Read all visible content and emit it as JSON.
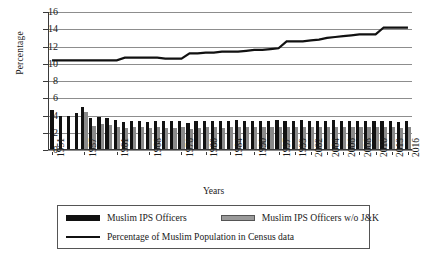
{
  "chart_data": {
    "type": "bar",
    "title": "",
    "xlabel": "Years",
    "ylabel": "Percentage",
    "ylim": [
      0,
      16
    ],
    "ytick_values": [
      0,
      2,
      4,
      6,
      8,
      10,
      12,
      14,
      16
    ],
    "ytick_labels": [
      "0",
      "2",
      "4",
      "6",
      "8",
      "10",
      "12",
      "14",
      "16"
    ],
    "grid": true,
    "legend_position": "bottom",
    "categories": [
      "1951",
      "1952",
      "1953",
      "1954",
      "1957",
      "1958",
      "1959",
      "1960",
      "1961",
      "1963",
      "1965",
      "1966",
      "1968",
      "1970",
      "1972",
      "1974",
      "1976",
      "1978",
      "1979",
      "1980",
      "1982",
      "1983",
      "1984",
      "1986",
      "1988",
      "1990",
      "1992",
      "1994",
      "1997",
      "1998",
      "1999",
      "2000",
      "2002",
      "2003",
      "2004",
      "2005",
      "2006",
      "2007",
      "2008",
      "2009",
      "2010",
      "2011",
      "2013",
      "2015",
      "2016"
    ],
    "xtick_labels": [
      "1951",
      "1957",
      "1961",
      "1968",
      "1976",
      "1980",
      "1984",
      "1990",
      "1997",
      "1999",
      "2002",
      "2004",
      "2006",
      "2008",
      "2010",
      "2013",
      "2016"
    ],
    "xtick_indices": [
      0,
      4,
      8,
      12,
      16,
      19,
      22,
      25,
      28,
      30,
      32,
      34,
      36,
      38,
      40,
      42,
      44
    ],
    "series": [
      {
        "name": "Muslim IPS Officers",
        "color": "#111111",
        "values": [
          4.5,
          3.8,
          3.8,
          4.2,
          4.9,
          3.6,
          3.7,
          3.6,
          3.4,
          3.1,
          3.3,
          3.2,
          3.1,
          3.3,
          3.2,
          3.2,
          3.3,
          3.0,
          3.2,
          3.3,
          3.3,
          3.2,
          3.3,
          3.4,
          3.3,
          3.2,
          3.3,
          3.3,
          3.4,
          3.2,
          3.3,
          3.4,
          3.3,
          3.2,
          3.3,
          3.4,
          3.3,
          3.2,
          3.3,
          3.2,
          3.3,
          3.2,
          3.2,
          3.1,
          3.2
        ]
      },
      {
        "name": "Muslim IPS Officers w/o J&K",
        "color": "#8a8a8a",
        "values": [
          null,
          null,
          null,
          null,
          4.3,
          2.7,
          2.9,
          2.8,
          2.6,
          2.4,
          2.5,
          2.5,
          2.4,
          2.5,
          2.4,
          2.4,
          2.5,
          2.3,
          2.4,
          2.6,
          2.5,
          2.4,
          2.5,
          2.6,
          2.5,
          2.5,
          2.5,
          2.5,
          2.6,
          2.5,
          2.6,
          2.6,
          2.5,
          2.5,
          2.6,
          2.6,
          2.6,
          2.5,
          2.6,
          2.5,
          2.6,
          2.5,
          2.5,
          2.4,
          2.5
        ]
      },
      {
        "name": "Percentage of Muslim Population in Census data",
        "color": "#111111",
        "type": "line",
        "values": [
          10.4,
          10.4,
          10.4,
          10.4,
          10.4,
          10.4,
          10.4,
          10.4,
          10.4,
          10.7,
          10.7,
          10.7,
          10.7,
          10.7,
          10.6,
          10.6,
          10.6,
          11.2,
          11.2,
          11.3,
          11.3,
          11.4,
          11.4,
          11.4,
          11.5,
          11.6,
          11.6,
          11.7,
          11.8,
          12.6,
          12.6,
          12.6,
          12.7,
          12.8,
          13.0,
          13.1,
          13.2,
          13.3,
          13.4,
          13.4,
          13.4,
          14.2,
          14.2,
          14.2,
          14.2
        ]
      }
    ]
  },
  "legend": {
    "items": [
      {
        "label": "Muslim IPS Officers",
        "swatch": "black-bar"
      },
      {
        "label": "Muslim IPS Officers w/o J&K",
        "swatch": "gray-bar"
      },
      {
        "label": "Percentage of Muslim Population in Census data",
        "swatch": "black-line"
      }
    ]
  }
}
